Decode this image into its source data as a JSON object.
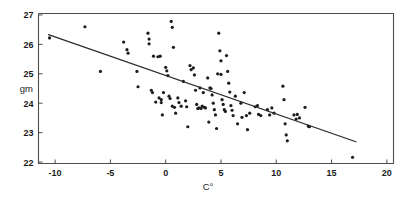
{
  "figure": {
    "background_color": "#ffffff",
    "width": 409,
    "height": 199
  },
  "chart_data": {
    "type": "scatter",
    "title": "",
    "subtitle": "",
    "xlabel": "C°",
    "ylabel": "gm",
    "xlim": [
      -11.5,
      20.6
    ],
    "ylim": [
      21.95,
      27.05
    ],
    "xticks": [
      -10,
      -5,
      0,
      5,
      10,
      15,
      20
    ],
    "xtick_labels": [
      "-10",
      "-5",
      "0",
      "5",
      "10",
      "15",
      "20"
    ],
    "yticks": [
      22,
      23,
      24,
      25,
      26,
      27
    ],
    "ytick_labels": [
      "22",
      "23",
      "24",
      "25",
      "26",
      "27"
    ],
    "grid": false,
    "legend": null,
    "legend_position": "none",
    "marker": "dot",
    "marker_color": "#1c1c1c",
    "marker_size": 1.6,
    "frame": "box",
    "annotations": [],
    "trendline": {
      "type": "linear",
      "color": "#2b2b2b",
      "x_start": -10.6,
      "y_start": 26.33,
      "x_end": 17.2,
      "y_end": 22.69,
      "slope": -0.131,
      "intercept": 24.94
    },
    "points": [
      [
        -10.5,
        26.22
      ],
      [
        -7.3,
        26.6
      ],
      [
        -5.9,
        25.08
      ],
      [
        -3.8,
        26.08
      ],
      [
        -3.5,
        25.82
      ],
      [
        -3.4,
        25.7
      ],
      [
        -2.6,
        25.08
      ],
      [
        -2.5,
        24.56
      ],
      [
        -1.6,
        26.38
      ],
      [
        -1.5,
        26.18
      ],
      [
        -1.5,
        26.02
      ],
      [
        -1.3,
        24.44
      ],
      [
        -1.2,
        24.36
      ],
      [
        -1.1,
        25.6
      ],
      [
        -0.9,
        24.04
      ],
      [
        -0.7,
        25.58
      ],
      [
        -0.6,
        24.18
      ],
      [
        -0.5,
        25.6
      ],
      [
        -0.4,
        24.12
      ],
      [
        -0.4,
        24.02
      ],
      [
        -0.3,
        23.6
      ],
      [
        -0.2,
        24.36
      ],
      [
        0.0,
        25.22
      ],
      [
        0.1,
        25.1
      ],
      [
        0.2,
        24.94
      ],
      [
        0.3,
        24.24
      ],
      [
        0.4,
        24.16
      ],
      [
        0.5,
        26.78
      ],
      [
        0.6,
        26.58
      ],
      [
        0.6,
        23.9
      ],
      [
        0.7,
        25.9
      ],
      [
        0.8,
        23.86
      ],
      [
        0.9,
        23.66
      ],
      [
        1.1,
        24.18
      ],
      [
        1.2,
        24.02
      ],
      [
        1.4,
        23.9
      ],
      [
        1.6,
        24.74
      ],
      [
        1.8,
        24.08
      ],
      [
        1.9,
        23.88
      ],
      [
        2.0,
        23.2
      ],
      [
        2.2,
        25.28
      ],
      [
        2.3,
        25.14
      ],
      [
        2.5,
        25.2
      ],
      [
        2.6,
        24.96
      ],
      [
        2.7,
        24.44
      ],
      [
        2.8,
        23.96
      ],
      [
        2.9,
        23.82
      ],
      [
        3.0,
        23.84
      ],
      [
        3.1,
        24.52
      ],
      [
        3.2,
        23.82
      ],
      [
        3.3,
        23.9
      ],
      [
        3.4,
        24.36
      ],
      [
        3.5,
        23.86
      ],
      [
        3.6,
        23.84
      ],
      [
        3.8,
        24.86
      ],
      [
        3.9,
        23.36
      ],
      [
        4.0,
        24.52
      ],
      [
        4.1,
        24.5
      ],
      [
        4.2,
        24.28
      ],
      [
        4.3,
        24.0
      ],
      [
        4.4,
        23.78
      ],
      [
        4.5,
        23.6
      ],
      [
        4.6,
        23.14
      ],
      [
        4.7,
        25.0
      ],
      [
        4.8,
        26.38
      ],
      [
        4.9,
        25.78
      ],
      [
        5.0,
        25.44
      ],
      [
        5.0,
        24.98
      ],
      [
        5.1,
        24.12
      ],
      [
        5.2,
        23.96
      ],
      [
        5.3,
        23.78
      ],
      [
        5.4,
        23.72
      ],
      [
        5.5,
        25.62
      ],
      [
        5.6,
        25.08
      ],
      [
        5.7,
        24.68
      ],
      [
        5.8,
        24.38
      ],
      [
        5.9,
        23.92
      ],
      [
        6.0,
        23.76
      ],
      [
        6.1,
        23.58
      ],
      [
        6.3,
        24.24
      ],
      [
        6.5,
        23.3
      ],
      [
        6.8,
        24.0
      ],
      [
        6.9,
        23.52
      ],
      [
        7.1,
        24.36
      ],
      [
        7.3,
        23.58
      ],
      [
        7.4,
        23.1
      ],
      [
        7.6,
        23.66
      ],
      [
        8.1,
        23.88
      ],
      [
        8.3,
        23.92
      ],
      [
        8.4,
        23.62
      ],
      [
        8.6,
        23.58
      ],
      [
        9.2,
        23.78
      ],
      [
        9.4,
        23.6
      ],
      [
        9.6,
        23.84
      ],
      [
        9.8,
        23.66
      ],
      [
        10.6,
        24.58
      ],
      [
        10.7,
        24.12
      ],
      [
        10.8,
        23.3
      ],
      [
        10.9,
        22.92
      ],
      [
        11.0,
        22.72
      ],
      [
        11.6,
        23.6
      ],
      [
        11.8,
        23.46
      ],
      [
        11.9,
        23.62
      ],
      [
        12.1,
        23.5
      ],
      [
        12.6,
        23.86
      ],
      [
        12.9,
        23.22
      ],
      [
        13.0,
        23.2
      ],
      [
        16.9,
        22.16
      ]
    ]
  }
}
